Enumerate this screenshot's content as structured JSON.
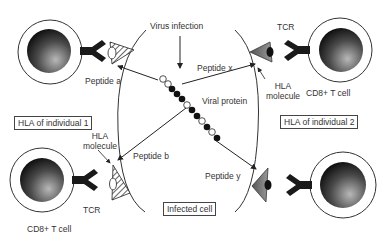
{
  "title": "Virus infection",
  "labels": {
    "virus_infection": "Virus infection",
    "peptide_a": "Peptide a",
    "peptide_b": "Peptide b",
    "peptide_x": "Peptide x",
    "peptide_y": "Peptide y",
    "viral_protein": "Viral protein",
    "tcr_top_right": "TCR",
    "tcr_bottom_left": "TCR",
    "hla_molecule_left": "HLA\nmolecule",
    "hla_molecule_left_line1": "HLA",
    "hla_molecule_left_line2": "molecule",
    "hla_molecule_right_line1": "HLA",
    "hla_molecule_right_line2": "molecule",
    "cd8_top_right": "CD8+ T cell",
    "cd8_bottom_left": "CD8+ T cell"
  },
  "boxes": {
    "hla_individual_1": "HLA of individual 1",
    "hla_individual_2": "HLA of individual 2",
    "infected_cell": "Infected cell"
  },
  "colors": {
    "cell_outline": "#333333",
    "nucleus_dark": "#111111",
    "nucleus_light": "#9a9a9a",
    "tcr": "#1a1a1a",
    "hla_right": "#666666",
    "arrow": "#333333"
  }
}
